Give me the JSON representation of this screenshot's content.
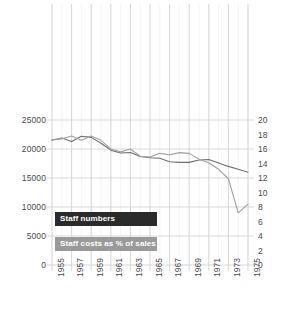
{
  "chart_data": {
    "type": "line",
    "title": "",
    "subtitle": "",
    "xlabel": "",
    "ylabel": "",
    "grid": true,
    "legend_position": "inside-lower-left",
    "x": [
      1955,
      1956,
      1957,
      1958,
      1959,
      1960,
      1961,
      1962,
      1963,
      1964,
      1965,
      1966,
      1967,
      1968,
      1969,
      1970,
      1971,
      1972,
      1973,
      1974,
      1975
    ],
    "xtick_labels": [
      "1955",
      "1957",
      "1959",
      "1961",
      "1963",
      "1965",
      "1967",
      "1969",
      "1971",
      "1973",
      "1975"
    ],
    "xtick_values": [
      1955,
      1957,
      1959,
      1961,
      1963,
      1965,
      1967,
      1969,
      1971,
      1973,
      1975
    ],
    "xlim": [
      1955,
      1975
    ],
    "axes": [
      {
        "side": "left",
        "name": "Staff numbers",
        "ylim": [
          0,
          25000
        ],
        "ticks": [
          0,
          5000,
          10000,
          15000,
          20000,
          25000
        ],
        "tick_labels": [
          "0",
          "5000",
          "10000",
          "15000",
          "20000",
          "25000"
        ]
      },
      {
        "side": "right",
        "name": "Staff costs as % of sales",
        "ylim": [
          0,
          20
        ],
        "ticks": [
          0,
          2,
          4,
          6,
          8,
          10,
          12,
          14,
          16,
          18,
          20
        ],
        "tick_labels": [
          "0",
          "2",
          "4",
          "6",
          "8",
          "10",
          "12",
          "14",
          "16",
          "18",
          "20"
        ]
      }
    ],
    "series": [
      {
        "name": "Staff numbers",
        "axis": "left",
        "color": "#6e6e6e",
        "values": [
          21500,
          21900,
          21300,
          22200,
          22000,
          21000,
          19800,
          19300,
          19400,
          18700,
          18500,
          18400,
          17800,
          17700,
          17700,
          18100,
          18200,
          17600,
          17000,
          16500,
          16000
        ]
      },
      {
        "name": "Staff costs as % of sales",
        "axis": "right",
        "color": "#a0a0a0",
        "values": [
          17.3,
          17.4,
          17.8,
          17.2,
          17.8,
          17.2,
          16.0,
          15.6,
          16.0,
          15.0,
          14.9,
          15.4,
          15.2,
          15.5,
          15.4,
          14.6,
          14.1,
          13.2,
          11.9,
          7.2,
          8.4
        ]
      }
    ]
  },
  "legend": {
    "staff_numbers_label": "Staff numbers",
    "staff_costs_label": "Staff costs as % of sales",
    "staff_numbers_color": "#2b2b2b",
    "staff_costs_color": "#9a9a9a"
  },
  "colors": {
    "gridline": "#cfcfcf",
    "minor_gridline": "#ededed",
    "axis_text": "#4a4a4a",
    "series_staff_numbers": "#6e6e6e",
    "series_staff_costs": "#a8a8a8"
  }
}
